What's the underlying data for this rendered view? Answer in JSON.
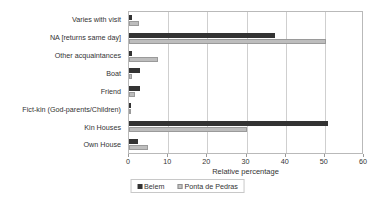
{
  "chart_data": {
    "type": "bar",
    "orientation": "horizontal",
    "title": "",
    "xlabel": "Relative percentage",
    "ylabel": "",
    "xlim": [
      0,
      60
    ],
    "xticks": [
      0,
      10,
      20,
      30,
      40,
      50,
      60
    ],
    "grid": true,
    "legend_position": "bottom",
    "categories": [
      "Own House",
      "Kin Houses",
      "Fict-kin (God-parents/Children)",
      "Friend",
      "Boat",
      "Other acquaintances",
      "NA [returns same day]",
      "Varies with visit"
    ],
    "series": [
      {
        "name": "Belem",
        "color": "#333333",
        "values": [
          2.3,
          50.7,
          0.5,
          2.8,
          2.8,
          0.7,
          37.3,
          0.7
        ]
      },
      {
        "name": "Ponta de Pedras",
        "color": "#bdbdbd",
        "values": [
          4.8,
          30.0,
          0.3,
          1.5,
          0.8,
          7.3,
          50.3,
          2.5
        ]
      }
    ]
  },
  "axis": {
    "x_title": "Relative percentage",
    "tick_labels": [
      "0",
      "10",
      "20",
      "30",
      "40",
      "50",
      "60"
    ]
  },
  "legend": {
    "items": [
      {
        "label": "Belem"
      },
      {
        "label": "Ponta de Pedras"
      }
    ]
  },
  "categories_display": [
    "Varies with visit",
    "NA [returns same day]",
    "Other acquaintances",
    "Boat",
    "Friend",
    "Fict-kin (God-parents/Children)",
    "Kin Houses",
    "Own House"
  ]
}
